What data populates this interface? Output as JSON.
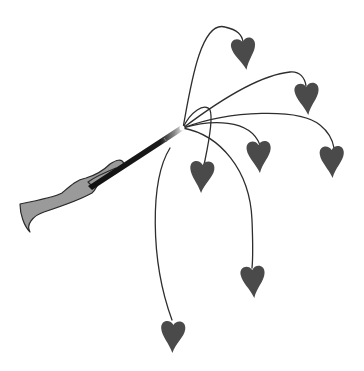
{
  "scene": {
    "title": "Hand holding magic wand with heart strings",
    "colors": {
      "background": "#ffffff",
      "heart": "#4a4a4a",
      "string": "#2e2e2e",
      "hand": "#9a9a9a",
      "wand": "#111111",
      "sparkle": "#f4f4f4"
    },
    "wand_tip": {
      "x": 183,
      "y": 128
    },
    "hearts": [
      {
        "id": "heart-top",
        "x": 244,
        "y": 52
      },
      {
        "id": "heart-upper-right",
        "x": 307,
        "y": 97
      },
      {
        "id": "heart-far-right",
        "x": 332,
        "y": 160
      },
      {
        "id": "heart-middle-right",
        "x": 259,
        "y": 155
      },
      {
        "id": "heart-left-middle",
        "x": 202,
        "y": 175
      },
      {
        "id": "heart-lower-right",
        "x": 253,
        "y": 280
      },
      {
        "id": "heart-bottom",
        "x": 173,
        "y": 335
      }
    ],
    "heart_count": 7
  }
}
